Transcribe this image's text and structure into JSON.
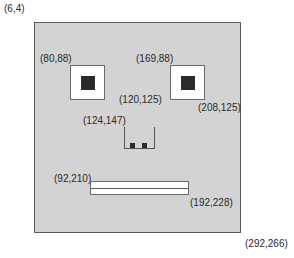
{
  "labels": {
    "face_top_left": "(6,4)",
    "face_bottom_right": "(292,266)",
    "left_eye_top_left": "(80,88)",
    "right_eye_top_left": "(169,88)",
    "left_eye_bottom_right": "(120,125)",
    "right_eye_bottom_right": "(208,125)",
    "nose_top_left": "(124,147)",
    "mouth_top_left": "(92,210)",
    "mouth_bottom_right": "(192,228)"
  },
  "colors": {
    "face_fill": "#d3d3d3",
    "outline": "#5a5a5a",
    "eye_fill": "#ffffff",
    "pupil": "#2b2b2b"
  }
}
